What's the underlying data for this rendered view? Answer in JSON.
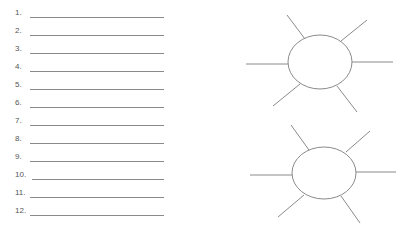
{
  "worksheet": {
    "numbered_list": [
      {
        "label": "1."
      },
      {
        "label": "2."
      },
      {
        "label": "3."
      },
      {
        "label": "4."
      },
      {
        "label": "5."
      },
      {
        "label": "6."
      },
      {
        "label": "7."
      },
      {
        "label": "8."
      },
      {
        "label": "9."
      },
      {
        "label": "10."
      },
      {
        "label": "11."
      },
      {
        "label": "12."
      }
    ],
    "diagrams": [
      {
        "type": "sun-web",
        "center": [
          320,
          62
        ],
        "rx": 32,
        "ry": 27,
        "rays": 6
      },
      {
        "type": "sun-web",
        "center": [
          324,
          173
        ],
        "rx": 32,
        "ry": 26,
        "rays": 6
      }
    ],
    "colors": {
      "line": "#8a8a8a",
      "text": "#555555"
    }
  }
}
